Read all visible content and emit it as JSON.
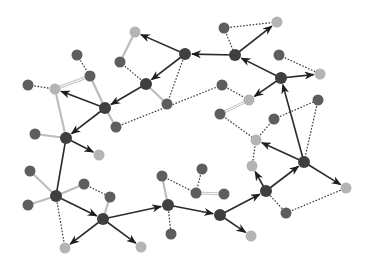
{
  "diagram": {
    "type": "directed-network-graph",
    "colors": {
      "hub": "#3f3f3f",
      "node_dark": "#5e5e5e",
      "node_light": "#b4b4b4",
      "edge_solid": "#2b2b2b",
      "edge_light": "#bdbdbd",
      "edge_dotted": "#3a3a3a",
      "background": "#ffffff"
    },
    "nodes": [
      {
        "id": "h1",
        "x": 185,
        "y": 54,
        "kind": "hub"
      },
      {
        "id": "h2",
        "x": 235,
        "y": 55,
        "kind": "hub"
      },
      {
        "id": "h3",
        "x": 146,
        "y": 84,
        "kind": "hub"
      },
      {
        "id": "h4",
        "x": 105,
        "y": 108,
        "kind": "hub"
      },
      {
        "id": "h5",
        "x": 66,
        "y": 138,
        "kind": "hub"
      },
      {
        "id": "h6",
        "x": 56,
        "y": 196,
        "kind": "hub"
      },
      {
        "id": "h7",
        "x": 103,
        "y": 219,
        "kind": "hub"
      },
      {
        "id": "h8",
        "x": 168,
        "y": 205,
        "kind": "hub"
      },
      {
        "id": "h9",
        "x": 220,
        "y": 215,
        "kind": "hub"
      },
      {
        "id": "h10",
        "x": 266,
        "y": 191,
        "kind": "hub"
      },
      {
        "id": "h11",
        "x": 304,
        "y": 162,
        "kind": "hub"
      },
      {
        "id": "h12",
        "x": 281,
        "y": 78,
        "kind": "hub"
      },
      {
        "id": "a1",
        "x": 135,
        "y": 32,
        "kind": "light"
      },
      {
        "id": "a2",
        "x": 120,
        "y": 62,
        "kind": "dark"
      },
      {
        "id": "a3",
        "x": 77,
        "y": 55,
        "kind": "dark"
      },
      {
        "id": "a4",
        "x": 90,
        "y": 76,
        "kind": "dark"
      },
      {
        "id": "a5",
        "x": 55,
        "y": 89,
        "kind": "light"
      },
      {
        "id": "a6",
        "x": 28,
        "y": 85,
        "kind": "dark"
      },
      {
        "id": "a7",
        "x": 116,
        "y": 127,
        "kind": "dark"
      },
      {
        "id": "a8",
        "x": 167,
        "y": 104,
        "kind": "dark"
      },
      {
        "id": "a9",
        "x": 224,
        "y": 28,
        "kind": "dark"
      },
      {
        "id": "a10",
        "x": 277,
        "y": 22,
        "kind": "light"
      },
      {
        "id": "a11",
        "x": 279,
        "y": 55,
        "kind": "dark"
      },
      {
        "id": "a12",
        "x": 320,
        "y": 74,
        "kind": "light"
      },
      {
        "id": "a13",
        "x": 222,
        "y": 85,
        "kind": "dark"
      },
      {
        "id": "a14",
        "x": 249,
        "y": 100,
        "kind": "light"
      },
      {
        "id": "a15",
        "x": 220,
        "y": 114,
        "kind": "dark"
      },
      {
        "id": "a16",
        "x": 274,
        "y": 119,
        "kind": "dark"
      },
      {
        "id": "a17",
        "x": 318,
        "y": 100,
        "kind": "dark"
      },
      {
        "id": "a18",
        "x": 256,
        "y": 140,
        "kind": "light"
      },
      {
        "id": "a19",
        "x": 252,
        "y": 166,
        "kind": "light"
      },
      {
        "id": "a20",
        "x": 346,
        "y": 188,
        "kind": "light"
      },
      {
        "id": "a21",
        "x": 286,
        "y": 213,
        "kind": "dark"
      },
      {
        "id": "a22",
        "x": 35,
        "y": 134,
        "kind": "dark"
      },
      {
        "id": "a23",
        "x": 99,
        "y": 155,
        "kind": "light"
      },
      {
        "id": "a24",
        "x": 30,
        "y": 171,
        "kind": "dark"
      },
      {
        "id": "a25",
        "x": 28,
        "y": 205,
        "kind": "dark"
      },
      {
        "id": "a26",
        "x": 84,
        "y": 184,
        "kind": "dark"
      },
      {
        "id": "a27",
        "x": 110,
        "y": 197,
        "kind": "dark"
      },
      {
        "id": "a28",
        "x": 65,
        "y": 248,
        "kind": "light"
      },
      {
        "id": "a29",
        "x": 141,
        "y": 247,
        "kind": "light"
      },
      {
        "id": "a30",
        "x": 162,
        "y": 176,
        "kind": "dark"
      },
      {
        "id": "a31",
        "x": 171,
        "y": 234,
        "kind": "dark"
      },
      {
        "id": "a32",
        "x": 202,
        "y": 169,
        "kind": "dark"
      },
      {
        "id": "a33",
        "x": 196,
        "y": 193,
        "kind": "dark"
      },
      {
        "id": "a34",
        "x": 224,
        "y": 194,
        "kind": "dark"
      },
      {
        "id": "a35",
        "x": 251,
        "y": 236,
        "kind": "light"
      }
    ],
    "edges": [
      {
        "from": "h2",
        "to": "h1",
        "style": "arrow"
      },
      {
        "from": "h1",
        "to": "a1",
        "style": "arrow"
      },
      {
        "from": "h1",
        "to": "h3",
        "style": "arrow"
      },
      {
        "from": "h3",
        "to": "h4",
        "style": "arrow"
      },
      {
        "from": "h4",
        "to": "a5",
        "style": "arrow"
      },
      {
        "from": "h4",
        "to": "h5",
        "style": "arrow"
      },
      {
        "from": "h5",
        "to": "a23",
        "style": "arrow"
      },
      {
        "from": "h6",
        "to": "h7",
        "style": "arrow"
      },
      {
        "from": "h7",
        "to": "a28",
        "style": "arrow"
      },
      {
        "from": "h7",
        "to": "a29",
        "style": "arrow"
      },
      {
        "from": "h7",
        "to": "h8",
        "style": "arrow"
      },
      {
        "from": "h8",
        "to": "h9",
        "style": "arrow"
      },
      {
        "from": "h9",
        "to": "a35",
        "style": "arrow"
      },
      {
        "from": "h9",
        "to": "h10",
        "style": "arrow"
      },
      {
        "from": "h10",
        "to": "a19",
        "style": "arrow"
      },
      {
        "from": "h10",
        "to": "h11",
        "style": "arrow"
      },
      {
        "from": "h11",
        "to": "a18",
        "style": "arrow"
      },
      {
        "from": "h11",
        "to": "a20",
        "style": "arrow"
      },
      {
        "from": "h11",
        "to": "h12",
        "style": "arrow"
      },
      {
        "from": "h12",
        "to": "h2",
        "style": "arrow"
      },
      {
        "from": "h12",
        "to": "a12",
        "style": "arrow"
      },
      {
        "from": "h12",
        "to": "a14",
        "style": "arrow"
      },
      {
        "from": "h2",
        "to": "a10",
        "style": "arrow"
      },
      {
        "from": "h5",
        "to": "h6",
        "style": "solid"
      },
      {
        "from": "a1",
        "to": "a2",
        "style": "light"
      },
      {
        "from": "a5",
        "to": "h5",
        "style": "light"
      },
      {
        "from": "a4",
        "to": "h4",
        "style": "light"
      },
      {
        "from": "h4",
        "to": "a7",
        "style": "light"
      },
      {
        "from": "h3",
        "to": "a8",
        "style": "light"
      },
      {
        "from": "a22",
        "to": "h5",
        "style": "light"
      },
      {
        "from": "a24",
        "to": "h6",
        "style": "light"
      },
      {
        "from": "a25",
        "to": "h6",
        "style": "light"
      },
      {
        "from": "a26",
        "to": "h6",
        "style": "light"
      },
      {
        "from": "a27",
        "to": "h7",
        "style": "light"
      },
      {
        "from": "a30",
        "to": "h8",
        "style": "light"
      },
      {
        "from": "a5",
        "to": "a4",
        "style": "double"
      },
      {
        "from": "a15",
        "to": "a14",
        "style": "double"
      },
      {
        "from": "a33",
        "to": "a34",
        "style": "double"
      },
      {
        "from": "a3",
        "to": "a4",
        "style": "dotted"
      },
      {
        "from": "a6",
        "to": "a5",
        "style": "dotted"
      },
      {
        "from": "a2",
        "to": "h3",
        "style": "dotted"
      },
      {
        "from": "a7",
        "to": "a13",
        "style": "dotted"
      },
      {
        "from": "a13",
        "to": "a14",
        "style": "dotted"
      },
      {
        "from": "h1",
        "to": "a8",
        "style": "dotted"
      },
      {
        "from": "a9",
        "to": "a10",
        "style": "dotted"
      },
      {
        "from": "a9",
        "to": "h2",
        "style": "dotted"
      },
      {
        "from": "a11",
        "to": "a12",
        "style": "dotted"
      },
      {
        "from": "a15",
        "to": "a18",
        "style": "dotted"
      },
      {
        "from": "a18",
        "to": "a16",
        "style": "dotted"
      },
      {
        "from": "a16",
        "to": "a17",
        "style": "dotted"
      },
      {
        "from": "a17",
        "to": "h11",
        "style": "dotted"
      },
      {
        "from": "a18",
        "to": "a19",
        "style": "dotted"
      },
      {
        "from": "h10",
        "to": "a21",
        "style": "dotted"
      },
      {
        "from": "a21",
        "to": "a20",
        "style": "dotted"
      },
      {
        "from": "h6",
        "to": "a28",
        "style": "dotted"
      },
      {
        "from": "a26",
        "to": "a27",
        "style": "dotted"
      },
      {
        "from": "a30",
        "to": "a33",
        "style": "dotted"
      },
      {
        "from": "a32",
        "to": "a33",
        "style": "dotted"
      },
      {
        "from": "h8",
        "to": "a31",
        "style": "dotted"
      }
    ]
  }
}
